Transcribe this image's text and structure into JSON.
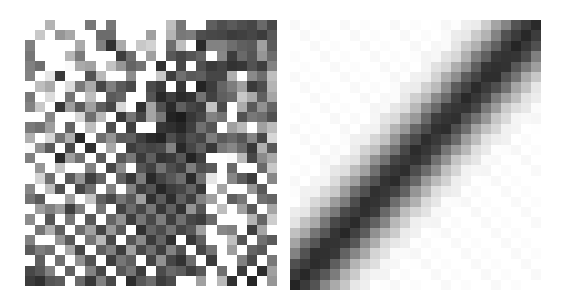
{
  "figure": {
    "title": "",
    "background_color": "#ffffff",
    "width": 565,
    "height": 306,
    "panel_count": 2
  },
  "panels": [
    {
      "name": "left-heatmap",
      "caption": "",
      "description": "unstructured random grayscale matrix",
      "x": 25,
      "y": 20,
      "width": 252,
      "height": 266,
      "rows": 26,
      "cols": 25,
      "cell_width": 10.08,
      "cell_height": 10.23,
      "colormap": "grayscale",
      "vmin": 0.0,
      "vmax": 1.0
    },
    {
      "name": "right-heatmap",
      "caption": "",
      "description": "smooth banded anti-diagonal grayscale matrix",
      "x": 290,
      "y": 20,
      "width": 251,
      "height": 270,
      "rows": 26,
      "cols": 25,
      "cell_width": 10.04,
      "cell_height": 10.38,
      "colormap": "grayscale",
      "vmin": 0.0,
      "vmax": 1.0
    }
  ],
  "chart_data": [
    {
      "type": "heatmap",
      "name": "left-heatmap",
      "title": "",
      "xlabel": "",
      "ylabel": "",
      "colormap": "gray",
      "vmin": 0,
      "vmax": 255,
      "rows": 26,
      "cols": 25,
      "grid": false,
      "legend": "none",
      "values": [
        [
          255,
          255,
          180,
          255,
          255,
          255,
          120,
          255,
          120,
          255,
          255,
          255,
          255,
          255,
          190,
          118,
          255,
          255,
          95,
          78,
          90,
          78,
          70,
          105,
          72
        ],
        [
          255,
          200,
          255,
          150,
          168,
          255,
          255,
          108,
          108,
          255,
          255,
          255,
          160,
          255,
          180,
          120,
          125,
          78,
          72,
          70,
          60,
          64,
          70,
          60,
          88
        ],
        [
          128,
          255,
          255,
          255,
          255,
          170,
          255,
          128,
          48,
          170,
          255,
          200,
          210,
          255,
          110,
          190,
          255,
          42,
          130,
          130,
          110,
          95,
          90,
          160,
          90
        ],
        [
          118,
          255,
          255,
          255,
          182,
          122,
          255,
          255,
          255,
          60,
          110,
          255,
          160,
          255,
          88,
          70,
          85,
          100,
          255,
          135,
          60,
          105,
          85,
          150,
          108
        ],
        [
          128,
          110,
          255,
          255,
          250,
          170,
          162,
          255,
          195,
          150,
          100,
          115,
          255,
          48,
          255,
          72,
          255,
          80,
          58,
          68,
          50,
          55,
          82,
          62,
          130
        ],
        [
          130,
          255,
          230,
          58,
          255,
          255,
          82,
          185,
          255,
          255,
          140,
          255,
          255,
          200,
          62,
          112,
          90,
          95,
          70,
          70,
          175,
          255,
          138,
          110,
          190
        ],
        [
          255,
          190,
          170,
          255,
          220,
          120,
          170,
          70,
          128,
          90,
          72,
          255,
          75,
          58,
          255,
          55,
          255,
          35,
          60,
          100,
          125,
          160,
          58,
          78,
          180
        ],
        [
          120,
          255,
          220,
          255,
          115,
          255,
          190,
          255,
          90,
          100,
          255,
          255,
          85,
          40,
          62,
          42,
          50,
          115,
          65,
          95,
          105,
          200,
          170,
          95,
          165
        ],
        [
          130,
          200,
          255,
          55,
          158,
          90,
          160,
          95,
          70,
          215,
          255,
          48,
          165,
          80,
          42,
          95,
          70,
          60,
          195,
          75,
          255,
          172,
          90,
          145,
          100
        ],
        [
          255,
          255,
          135,
          255,
          255,
          215,
          110,
          185,
          255,
          55,
          118,
          70,
          165,
          120,
          35,
          28,
          55,
          70,
          130,
          115,
          255,
          82,
          120,
          110,
          80
        ],
        [
          122,
          112,
          158,
          255,
          100,
          255,
          190,
          255,
          78,
          255,
          62,
          255,
          255,
          55,
          48,
          38,
          62,
          112,
          85,
          255,
          160,
          185,
          255,
          160,
          188
        ],
        [
          175,
          255,
          215,
          115,
          175,
          40,
          255,
          110,
          148,
          90,
          95,
          62,
          42,
          35,
          78,
          55,
          80,
          68,
          125,
          90,
          105,
          85,
          132,
          70,
          215
        ],
        [
          250,
          145,
          90,
          255,
          72,
          255,
          48,
          255,
          168,
          255,
          60,
          78,
          68,
          75,
          130,
          40,
          70,
          95,
          55,
          120,
          135,
          105,
          55,
          175,
          88
        ],
        [
          128,
          255,
          255,
          42,
          158,
          112,
          255,
          92,
          255,
          88,
          120,
          58,
          95,
          50,
          58,
          88,
          35,
          62,
          255,
          255,
          250,
          185,
          70,
          138,
          168
        ],
        [
          255,
          150,
          255,
          195,
          255,
          255,
          130,
          255,
          70,
          140,
          255,
          85,
          65,
          115,
          78,
          62,
          125,
          78,
          90,
          255,
          105,
          255,
          255,
          105,
          200
        ],
        [
          255,
          212,
          112,
          255,
          88,
          148,
          62,
          100,
          255,
          98,
          55,
          125,
          40,
          68,
          88,
          110,
          42,
          112,
          230,
          255,
          135,
          92,
          60,
          255,
          135
        ],
        [
          135,
          255,
          190,
          80,
          255,
          70,
          112,
          255,
          130,
          255,
          130,
          62,
          85,
          38,
          60,
          70,
          100,
          55,
          255,
          165,
          255,
          255,
          150,
          88,
          255
        ],
        [
          115,
          88,
          255,
          255,
          160,
          255,
          198,
          95,
          70,
          118,
          88,
          160,
          48,
          92,
          45,
          95,
          62,
          130,
          160,
          255,
          95,
          118,
          255,
          112,
          100
        ],
        [
          255,
          158,
          128,
          155,
          62,
          125,
          255,
          118,
          255,
          65,
          108,
          70,
          120,
          55,
          98,
          50,
          148,
          85,
          255,
          190,
          255,
          160,
          88,
          255,
          165
        ],
        [
          140,
          255,
          85,
          255,
          118,
          255,
          88,
          255,
          100,
          145,
          60,
          118,
          72,
          125,
          62,
          112,
          70,
          60,
          105,
          255,
          255,
          255,
          180,
          100,
          205
        ],
        [
          255,
          118,
          175,
          95,
          255,
          108,
          160,
          68,
          152,
          90,
          255,
          48,
          100,
          75,
          115,
          68,
          88,
          160,
          255,
          135,
          128,
          255,
          62,
          165,
          255
        ],
        [
          130,
          255,
          255,
          148,
          88,
          255,
          118,
          185,
          72,
          255,
          85,
          138,
          58,
          100,
          48,
          255,
          55,
          95,
          255,
          255,
          192,
          85,
          255,
          112,
          90
        ],
        [
          90,
          125,
          112,
          255,
          168,
          70,
          255,
          95,
          128,
          60,
          160,
          72,
          110,
          62,
          130,
          82,
          255,
          70,
          115,
          255,
          158,
          255,
          100,
          88,
          255
        ],
        [
          255,
          95,
          255,
          112,
          255,
          145,
          82,
          255,
          62,
          118,
          95,
          255,
          68,
          145,
          70,
          50,
          108,
          255,
          60,
          255,
          255,
          128,
          75,
          255,
          120
        ],
        [
          72,
          88,
          130,
          255,
          98,
          255,
          130,
          70,
          255,
          88,
          118,
          60,
          255,
          75,
          105,
          92,
          62,
          88,
          255,
          112,
          255,
          60,
          255,
          45,
          160
        ],
        [
          60,
          48,
          85,
          92,
          255,
          105,
          55,
          128,
          72,
          255,
          45,
          88,
          108,
          60,
          75,
          255,
          255,
          160,
          255,
          185,
          48,
          255,
          38,
          255,
          150
        ]
      ]
    },
    {
      "type": "heatmap",
      "name": "right-heatmap",
      "title": "",
      "xlabel": "",
      "ylabel": "",
      "colormap": "gray",
      "vmin": 0,
      "vmax": 255,
      "rows": 26,
      "cols": 25,
      "grid": false,
      "legend": "none",
      "structure": "banded anti-diagonal: dark band runs from bottom-left to top-right; corners (top-left and bottom-right) are white",
      "band_model": {
        "dark_value": 60,
        "light_value": 255,
        "band_halfwidth_cells": 3.2,
        "falloff": "gaussian",
        "diagonal_direction": "anti"
      }
    }
  ]
}
